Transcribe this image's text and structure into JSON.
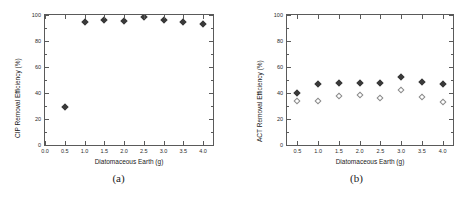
{
  "figure": {
    "panels": [
      {
        "caption": "(a)",
        "xlabel": "Diatomaceous Earth (g)",
        "ylabel": "CIP Removal Efficiency (%)",
        "xticks": [
          "0.0",
          "0.5",
          "1.0",
          "1.5",
          "2.0",
          "2.5",
          "3.0",
          "3.5",
          "4.0"
        ],
        "yticks": [
          "0",
          "20",
          "40",
          "60",
          "80",
          "100"
        ]
      },
      {
        "caption": "(b)",
        "xlabel": "Diatomaceous Earth (g)",
        "ylabel": "ACT Removal Efficiency (%)",
        "xticks": [
          "0.5",
          "1.0",
          "1.5",
          "2.0",
          "2.5",
          "3.0",
          "3.5",
          "4.0"
        ],
        "yticks": [
          "0",
          "20",
          "40",
          "60",
          "80",
          "100"
        ]
      }
    ]
  },
  "chart_data": [
    {
      "type": "scatter",
      "title": "(a)",
      "xlabel": "Diatomaceous Earth (g)",
      "ylabel": "CIP Removal Efficiency (%)",
      "xlim": [
        0.0,
        4.25
      ],
      "ylim": [
        0,
        100
      ],
      "xticks": [
        0.0,
        0.5,
        1.0,
        1.5,
        2.0,
        2.5,
        3.0,
        3.5,
        4.0
      ],
      "yticks": [
        0,
        20,
        40,
        60,
        80,
        100
      ],
      "grid": false,
      "legend": "none",
      "series": [
        {
          "name": "CIP removal efficiency",
          "marker": "filled-diamond",
          "color": "#3a3a3a",
          "x": [
            0.5,
            1.0,
            1.5,
            2.0,
            2.5,
            3.0,
            3.5,
            4.0
          ],
          "values": [
            29.0,
            94.5,
            95.8,
            95.5,
            98.8,
            95.8,
            94.5,
            92.8
          ]
        }
      ]
    },
    {
      "type": "scatter",
      "title": "(b)",
      "xlabel": "Diatomaceous Earth (g)",
      "ylabel": "ACT Removal Efficiency (%)",
      "xlim": [
        0.25,
        4.25
      ],
      "ylim": [
        0,
        100
      ],
      "xticks": [
        0.5,
        1.0,
        1.5,
        2.0,
        2.5,
        3.0,
        3.5,
        4.0
      ],
      "yticks": [
        0,
        20,
        40,
        60,
        80,
        100
      ],
      "grid": false,
      "legend": "none",
      "series": [
        {
          "name": "ACT removal efficiency (filled)",
          "marker": "filled-diamond",
          "color": "#3a3a3a",
          "x": [
            0.5,
            1.0,
            1.5,
            2.0,
            2.5,
            3.0,
            3.5,
            4.0
          ],
          "values": [
            40.2,
            47.3,
            47.5,
            47.6,
            48.0,
            52.0,
            48.8,
            46.8
          ]
        },
        {
          "name": "ACT removal efficiency (open)",
          "marker": "open-diamond",
          "color": "#8a8a8a",
          "x": [
            0.5,
            1.0,
            1.5,
            2.0,
            2.5,
            3.0,
            3.5,
            4.0
          ],
          "values": [
            33.5,
            33.8,
            37.5,
            38.3,
            36.0,
            42.0,
            36.8,
            33.4
          ]
        }
      ]
    }
  ]
}
